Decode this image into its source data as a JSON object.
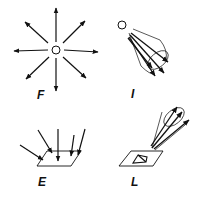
{
  "panels": [
    {
      "id": "F",
      "label": "F",
      "description": "point source emitting in all directions"
    },
    {
      "id": "I",
      "label": "I",
      "description": "point source emitting a cone of rays"
    },
    {
      "id": "E",
      "label": "E",
      "description": "rays incident on a surface"
    },
    {
      "id": "L",
      "label": "L",
      "description": "rays leaving a surface patch in a cone"
    }
  ],
  "colors": {
    "stroke": "#111111",
    "background": "#ffffff"
  }
}
